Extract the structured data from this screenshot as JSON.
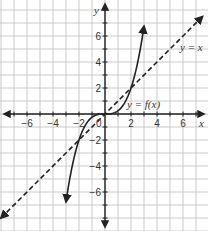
{
  "chart_data": {
    "type": "line",
    "title": "",
    "xlabel": "x",
    "ylabel": "y",
    "xlim": [
      -8,
      7.7
    ],
    "ylim": [
      -8.8,
      8.7
    ],
    "grid": true,
    "x_ticks": [
      -6,
      -4,
      -2,
      2,
      4,
      6
    ],
    "y_ticks": [
      6,
      4,
      2,
      -2,
      -4,
      -6
    ],
    "origin_label": "0",
    "series": [
      {
        "name": "y = f(x)",
        "style": "solid",
        "description": "cubic-like curve through (0,0) and (2,2), arrows at both ends",
        "x": [
          -3,
          -2.5,
          -2,
          -1.5,
          -1,
          -0.5,
          0,
          0.5,
          1,
          1.5,
          2,
          2.5,
          3
        ],
        "y": [
          -6.75,
          -3.9,
          -2,
          -0.84,
          -0.25,
          -0.03,
          0,
          0.03,
          0.25,
          0.84,
          2,
          3.9,
          6.75
        ]
      },
      {
        "name": "y = x",
        "style": "dashed",
        "description": "identity line, arrows at both ends",
        "x": [
          -8,
          7.5
        ],
        "y": [
          -8,
          7.5
        ]
      }
    ],
    "annotations": [
      {
        "text": "y = f(x)",
        "x": 2.4,
        "y": 0.7
      },
      {
        "text": "y = x",
        "x": 6.7,
        "y": 5.2
      }
    ]
  },
  "labels": {
    "x_axis": "x",
    "y_axis": "y",
    "origin": "0",
    "curve_f": "y = f(x)",
    "curve_identity": "y = x",
    "x_ticks": [
      "−6",
      "−4",
      "−2",
      "2",
      "4",
      "6"
    ],
    "y_ticks": [
      "6",
      "4",
      "2",
      "−2",
      "−4",
      "−6"
    ]
  }
}
